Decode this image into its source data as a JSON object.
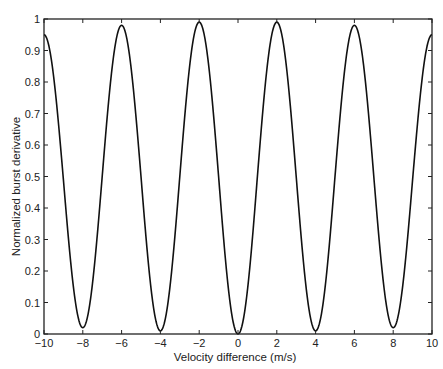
{
  "chart_data": {
    "type": "line",
    "title": "",
    "xlabel": "Velocity difference (m/s)",
    "ylabel": "Normalized burst derivative",
    "xlim": [
      -10,
      10
    ],
    "ylim": [
      0,
      1
    ],
    "grid": false,
    "legend": null,
    "xticks": [
      -10,
      -8,
      -6,
      -4,
      -2,
      0,
      2,
      4,
      6,
      8,
      10
    ],
    "yticks": [
      0,
      0.1,
      0.2,
      0.3,
      0.4,
      0.5,
      0.6,
      0.7,
      0.8,
      0.9,
      1
    ],
    "xtick_labels": [
      "−10",
      "−8",
      "−6",
      "−4",
      "−2",
      "0",
      "2",
      "4",
      "6",
      "8",
      "10"
    ],
    "ytick_labels": [
      "0",
      "0.1",
      "0.2",
      "0.3",
      "0.4",
      "0.5",
      "0.6",
      "0.7",
      "0.8",
      "0.9",
      "1"
    ],
    "series": [
      {
        "name": "burst derivative",
        "color": "#111111",
        "x": [
          -10,
          -9,
          -8,
          -7,
          -6,
          -5,
          -4,
          -3,
          -2,
          -1,
          0,
          1,
          2,
          3,
          4,
          5,
          6,
          7,
          8,
          9,
          10
        ],
        "y": [
          0.95,
          0.49,
          0.02,
          0.5,
          0.98,
          0.5,
          0.01,
          0.5,
          0.99,
          0.5,
          0.0,
          0.5,
          0.99,
          0.5,
          0.01,
          0.5,
          0.98,
          0.5,
          0.02,
          0.49,
          0.95
        ]
      }
    ],
    "key_points": {
      "peaks": [
        {
          "x": -6,
          "y": 0.98
        },
        {
          "x": -2,
          "y": 0.99
        },
        {
          "x": 2,
          "y": 0.99
        },
        {
          "x": 6,
          "y": 0.98
        }
      ],
      "minima": [
        {
          "x": -8,
          "y": 0.02
        },
        {
          "x": -4,
          "y": 0.01
        },
        {
          "x": 0,
          "y": 0.0
        },
        {
          "x": 4,
          "y": 0.01
        },
        {
          "x": 8,
          "y": 0.02
        }
      ],
      "endpoints": [
        {
          "x": -10,
          "y": 0.95
        },
        {
          "x": 10,
          "y": 0.95
        }
      ]
    }
  }
}
